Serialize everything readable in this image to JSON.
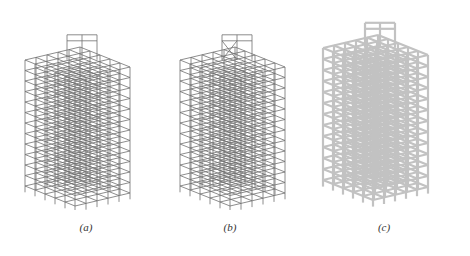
{
  "figure": {
    "panels": [
      {
        "id": "a",
        "label": "(a)",
        "description": "3D wireframe structural frame model (line elements)",
        "stroke": "#6b6b6b"
      },
      {
        "id": "b",
        "label": "(b)",
        "description": "3D wireframe structural frame model with braced rooftop",
        "stroke": "#6b6b6b"
      },
      {
        "id": "c",
        "label": "(c)",
        "description": "3D extruded solid structural frame model",
        "stroke": "#bdbdbd"
      }
    ]
  }
}
